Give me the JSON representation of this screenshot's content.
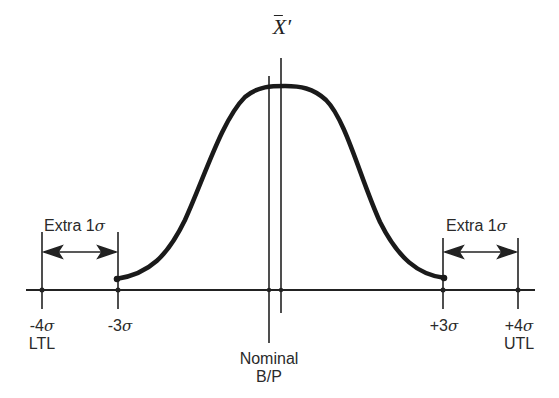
{
  "diagram": {
    "mean_label": "X̄′",
    "mean_symbol": "X",
    "mean_prime": "′",
    "nominal_label_line1": "Nominal",
    "nominal_label_line2": "B/P",
    "left_extra": {
      "text": "Extra 1",
      "sigma": "σ"
    },
    "right_extra": {
      "text": "Extra 1",
      "sigma": "σ"
    },
    "ticks": [
      {
        "value": "-4",
        "sigma": "σ",
        "sub": "LTL",
        "x": 42
      },
      {
        "value": "-3",
        "sigma": "σ",
        "sub": "",
        "x": 118
      },
      {
        "value": "+3",
        "sigma": "σ",
        "sub": "",
        "x": 443
      },
      {
        "value": "+4",
        "sigma": "σ",
        "sub": "UTL",
        "x": 518
      }
    ],
    "curve": "normal distribution truncated at ±3σ, mean shifted right of nominal",
    "colors": {
      "ink": "#222222",
      "background": "#ffffff"
    }
  }
}
